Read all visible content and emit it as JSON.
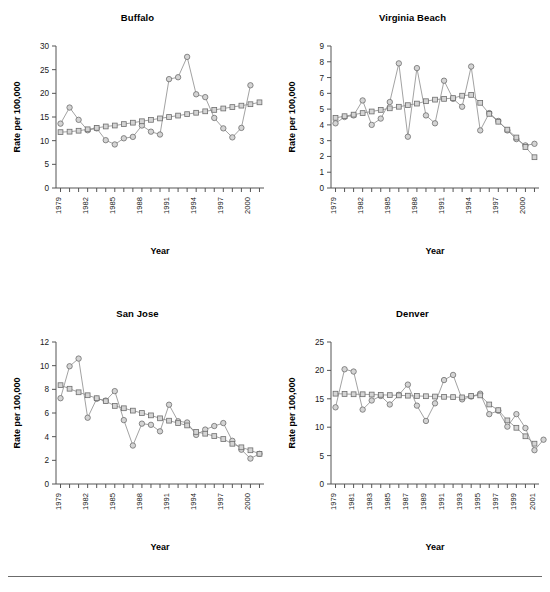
{
  "figure": {
    "background": "#ffffff",
    "accent_marker_fill": "#d4d4d4",
    "accent_marker_stroke": "#6e6e6e",
    "line_color": "#8a8a8a",
    "axis_color": "#555555",
    "footer_rule": true
  },
  "chart_data": [
    {
      "type": "line",
      "title": "Buffalo",
      "xlabel": "Year",
      "ylabel": "Rate per 100,000",
      "x": [
        1979,
        1980,
        1981,
        1982,
        1983,
        1984,
        1985,
        1986,
        1987,
        1988,
        1989,
        1990,
        1991,
        1992,
        1993,
        1994,
        1995,
        1996,
        1997,
        1998,
        1999,
        2000,
        2001
      ],
      "xlim": [
        1978.5,
        2001.5
      ],
      "ylim": [
        0,
        30
      ],
      "yticks": [
        0,
        5,
        10,
        15,
        20,
        25,
        30
      ],
      "xtick_labels": [
        "1979",
        "",
        "",
        "1982",
        "",
        "",
        "1985",
        "",
        "",
        "1988",
        "",
        "",
        "1991",
        "",
        "",
        "1994",
        "",
        "",
        "1997",
        "",
        "",
        "2000",
        "",
        ""
      ],
      "xtick_labels_shown": [
        "1979",
        "1982",
        "1985",
        "1988",
        "1991",
        "1994",
        "1997",
        "2000"
      ],
      "grid": false,
      "legend": "none",
      "series": [
        {
          "name": "Observed",
          "marker": "circle",
          "values": [
            13.6,
            17.0,
            14.4,
            12.2,
            12.6,
            10.1,
            9.2,
            10.5,
            10.8,
            13.2,
            11.9,
            11.3,
            23.0,
            23.4,
            27.7,
            19.8,
            19.2,
            14.8,
            12.6,
            10.7,
            12.7,
            21.7,
            null
          ]
        },
        {
          "name": "Fitted",
          "marker": "square",
          "values": [
            11.8,
            11.9,
            12.1,
            12.4,
            12.7,
            13.0,
            13.2,
            13.5,
            13.8,
            14.1,
            14.4,
            14.7,
            15.0,
            15.3,
            15.6,
            15.9,
            16.2,
            16.5,
            16.8,
            17.1,
            17.4,
            17.7,
            18.1
          ]
        }
      ]
    },
    {
      "type": "line",
      "title": "Virginia Beach",
      "xlabel": "Year",
      "ylabel": "Rate per 100,000",
      "x": [
        1979,
        1980,
        1981,
        1982,
        1983,
        1984,
        1985,
        1986,
        1987,
        1988,
        1989,
        1990,
        1991,
        1992,
        1993,
        1994,
        1995,
        1996,
        1997,
        1998,
        1999,
        2000,
        2001
      ],
      "xlim": [
        1978.5,
        2001.5
      ],
      "ylim": [
        0,
        9
      ],
      "yticks": [
        0,
        1,
        2,
        3,
        4,
        5,
        6,
        7,
        8,
        9
      ],
      "xtick_labels_shown": [
        "1979",
        "1982",
        "1985",
        "1988",
        "1991",
        "1994",
        "1997",
        "2000"
      ],
      "grid": false,
      "legend": "none",
      "series": [
        {
          "name": "Observed",
          "marker": "circle",
          "values": [
            4.1,
            4.5,
            4.6,
            5.55,
            4.0,
            4.4,
            5.45,
            7.9,
            3.25,
            7.6,
            4.6,
            4.1,
            6.8,
            5.65,
            5.15,
            7.7,
            3.65,
            4.75,
            4.25,
            3.65,
            3.1,
            2.7,
            2.8
          ]
        },
        {
          "name": "Fitted",
          "marker": "square",
          "values": [
            4.45,
            4.55,
            4.65,
            4.75,
            4.85,
            4.95,
            5.05,
            5.15,
            5.25,
            5.35,
            5.5,
            5.6,
            5.65,
            5.7,
            5.85,
            5.9,
            5.4,
            4.7,
            4.2,
            3.7,
            3.2,
            2.6,
            1.95
          ]
        }
      ]
    },
    {
      "type": "line",
      "title": "San Jose",
      "xlabel": "Year",
      "ylabel": "Rate per 100,000",
      "x": [
        1979,
        1980,
        1981,
        1982,
        1983,
        1984,
        1985,
        1986,
        1987,
        1988,
        1989,
        1990,
        1991,
        1992,
        1993,
        1994,
        1995,
        1996,
        1997,
        1998,
        1999,
        2000,
        2001
      ],
      "xlim": [
        1978.5,
        2001.5
      ],
      "ylim": [
        0,
        12
      ],
      "yticks": [
        0,
        2,
        4,
        6,
        8,
        10,
        12
      ],
      "xtick_labels_shown": [
        "1979",
        "1982",
        "1985",
        "1988",
        "1991",
        "1994",
        "1997",
        "2000"
      ],
      "grid": false,
      "legend": "none",
      "series": [
        {
          "name": "Observed",
          "marker": "circle",
          "values": [
            7.25,
            9.95,
            10.6,
            5.6,
            7.2,
            7.05,
            7.85,
            5.4,
            3.25,
            5.1,
            5.0,
            4.45,
            6.7,
            5.3,
            5.2,
            4.15,
            4.6,
            4.9,
            5.15,
            3.65,
            2.9,
            2.15,
            2.55
          ]
        },
        {
          "name": "Fitted",
          "marker": "square",
          "values": [
            8.35,
            8.05,
            7.75,
            7.5,
            7.25,
            7.0,
            6.6,
            6.4,
            6.2,
            6.0,
            5.8,
            5.55,
            5.35,
            5.15,
            4.95,
            4.4,
            4.25,
            4.05,
            3.8,
            3.4,
            3.1,
            2.85,
            2.55
          ]
        }
      ]
    },
    {
      "type": "line",
      "title": "Denver",
      "xlabel": "Year",
      "ylabel": "Rate per 100,000",
      "x": [
        1979,
        1980,
        1981,
        1982,
        1983,
        1984,
        1985,
        1986,
        1987,
        1988,
        1989,
        1990,
        1991,
        1992,
        1993,
        1994,
        1995,
        1996,
        1997,
        1998,
        1999,
        2000,
        2001
      ],
      "xlim": [
        1978.5,
        2001.5
      ],
      "ylim": [
        0,
        25
      ],
      "yticks": [
        0,
        5,
        10,
        15,
        20,
        25
      ],
      "xtick_labels_shown": [
        "1979",
        "1981",
        "1983",
        "1985",
        "1987",
        "1989",
        "1991",
        "1993",
        "1995",
        "1997",
        "1999",
        "2001"
      ],
      "grid": false,
      "legend": "none",
      "series": [
        {
          "name": "Observed",
          "marker": "circle",
          "values": [
            13.5,
            20.2,
            19.8,
            13.1,
            14.7,
            15.5,
            14.0,
            15.7,
            17.5,
            13.8,
            11.1,
            14.2,
            18.3,
            19.2,
            14.9,
            15.4,
            15.9,
            12.3,
            12.9,
            10.1,
            12.3,
            9.85,
            5.95,
            7.8
          ]
        },
        {
          "name": "Fitted",
          "marker": "square",
          "values": [
            15.9,
            15.85,
            15.8,
            15.8,
            15.75,
            15.7,
            15.65,
            15.6,
            15.55,
            15.5,
            15.45,
            15.4,
            15.35,
            15.3,
            15.25,
            15.5,
            15.6,
            14.0,
            13.0,
            11.2,
            9.9,
            8.4,
            7.1
          ]
        }
      ]
    }
  ]
}
